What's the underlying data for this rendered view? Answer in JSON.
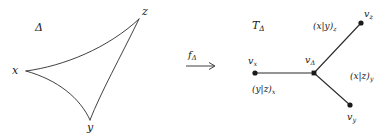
{
  "figure": {
    "stroke_color": "#2b2b2b",
    "text_color": "#1a1a1a",
    "background": "#ffffff"
  },
  "left_panel": {
    "region_label": "Δ",
    "vertices": [
      {
        "id": "x",
        "label": "x",
        "x": 14,
        "y": 72
      },
      {
        "id": "y",
        "label": "y",
        "x": 90,
        "y": 128
      },
      {
        "id": "z",
        "label": "z",
        "x": 144,
        "y": 12
      }
    ]
  },
  "map_arrow": {
    "label_base": "f",
    "label_sub": "Δ"
  },
  "right_panel": {
    "region_label_base": "T",
    "region_label_sub": "Δ",
    "vertices": [
      {
        "id": "v_x",
        "base": "v",
        "sub": "x",
        "label": "v_x"
      },
      {
        "id": "v_delta",
        "base": "v",
        "sub": "Δ",
        "label": "v_Δ"
      },
      {
        "id": "v_z",
        "base": "v",
        "sub": "z",
        "label": "v_z"
      },
      {
        "id": "v_y",
        "base": "v",
        "sub": "y",
        "label": "v_y"
      }
    ],
    "edge_labels": [
      {
        "id": "edge-x",
        "text": "(y|z)",
        "sub": "x"
      },
      {
        "id": "edge-z",
        "text": "(x|y)",
        "sub": "z"
      },
      {
        "id": "edge-y",
        "text": "(x|z)",
        "sub": "y"
      }
    ]
  }
}
